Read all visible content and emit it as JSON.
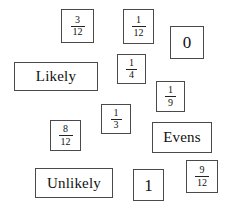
{
  "page": {
    "background_color": "#ffffff",
    "card_border_color": "#4a4a4a",
    "text_color": "#111111"
  },
  "cards": [
    {
      "id": "card-3-12",
      "name": "card-fraction-3-12",
      "kind": "fraction",
      "numerator": "3",
      "denominator": "12",
      "text": "3/12",
      "x": 61,
      "y": 9,
      "w": 33,
      "h": 34
    },
    {
      "id": "card-1-12",
      "name": "card-fraction-1-12",
      "kind": "fraction",
      "numerator": "1",
      "denominator": "12",
      "text": "1/12",
      "x": 123,
      "y": 9,
      "w": 31,
      "h": 35
    },
    {
      "id": "card-0",
      "name": "card-number-0",
      "kind": "whole",
      "value": "0",
      "x": 170,
      "y": 26,
      "w": 34,
      "h": 33
    },
    {
      "id": "card-likely",
      "name": "card-word-likely",
      "kind": "word",
      "value": "Likely",
      "x": 14,
      "y": 62,
      "w": 84,
      "h": 29
    },
    {
      "id": "card-1-4",
      "name": "card-fraction-1-4",
      "kind": "fraction",
      "numerator": "1",
      "denominator": "4",
      "text": "1/4",
      "x": 117,
      "y": 54,
      "w": 29,
      "h": 30
    },
    {
      "id": "card-1-9",
      "name": "card-fraction-1-9",
      "kind": "fraction",
      "numerator": "1",
      "denominator": "9",
      "text": "1/9",
      "x": 156,
      "y": 81,
      "w": 29,
      "h": 31
    },
    {
      "id": "card-1-3",
      "name": "card-fraction-1-3",
      "kind": "fraction",
      "numerator": "1",
      "denominator": "3",
      "text": "1/3",
      "x": 101,
      "y": 104,
      "w": 30,
      "h": 30
    },
    {
      "id": "card-8-12",
      "name": "card-fraction-8-12",
      "kind": "fraction",
      "numerator": "8",
      "denominator": "12",
      "text": "8/12",
      "x": 50,
      "y": 120,
      "w": 31,
      "h": 31
    },
    {
      "id": "card-evens",
      "name": "card-word-evens",
      "kind": "word",
      "value": "Evens",
      "x": 152,
      "y": 122,
      "w": 60,
      "h": 31
    },
    {
      "id": "card-9-12",
      "name": "card-fraction-9-12",
      "kind": "fraction",
      "numerator": "9",
      "denominator": "12",
      "text": "9/12",
      "x": 186,
      "y": 160,
      "w": 32,
      "h": 33
    },
    {
      "id": "card-unlikely",
      "name": "card-word-unlikely",
      "kind": "word",
      "value": "Unlikely",
      "x": 35,
      "y": 168,
      "w": 78,
      "h": 30
    },
    {
      "id": "card-1",
      "name": "card-number-1",
      "kind": "whole",
      "value": "1",
      "x": 133,
      "y": 169,
      "w": 31,
      "h": 32
    }
  ]
}
